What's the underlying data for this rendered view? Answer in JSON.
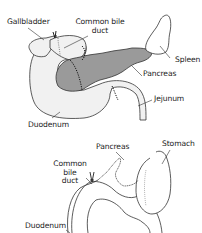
{
  "colors": {
    "organ_fill": "#f1f1f1",
    "pancreas_fill": "#9a9a9a",
    "outline": "#333333",
    "label_text": "#222222",
    "background": "#ffffff"
  },
  "top_diagram": {
    "labels": {
      "gallbladder": "Gallbladder",
      "common_bile_duct_line1": "Common bile",
      "common_bile_duct_line2": "duct",
      "spleen": "Spleen",
      "pancreas": "Pancreas",
      "jejunum": "Jejunum",
      "duodenum": "Duodenum"
    }
  },
  "bottom_diagram": {
    "labels": {
      "pancreas": "Pancreas",
      "stomach": "Stomach",
      "common_bile_duct_line1": "Common",
      "common_bile_duct_line2": "bile",
      "common_bile_duct_line3": "duct",
      "duodenum": "Duodenum"
    }
  }
}
